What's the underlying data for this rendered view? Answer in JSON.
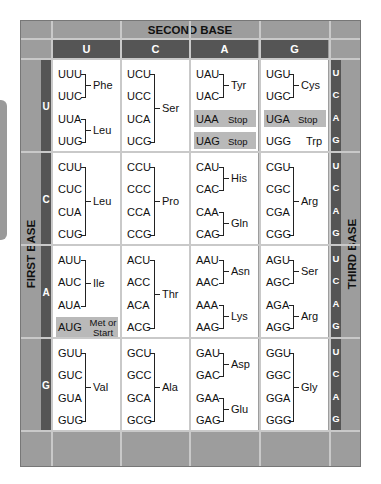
{
  "title": "SECOND BASE",
  "first_base_label": "FIRST BASE",
  "third_base_label": "THIRD BASE",
  "second_bases": [
    "U",
    "C",
    "A",
    "G"
  ],
  "first_bases": [
    "U",
    "C",
    "A",
    "G"
  ],
  "third_bases": [
    "U",
    "C",
    "A",
    "G"
  ],
  "colors": {
    "frame": "#9d9d9d",
    "bar": "#555555",
    "highlight": "#b9b9b9",
    "cell": "#ffffff"
  },
  "rows": [
    {
      "first": "U",
      "cells": [
        {
          "codons": [
            "UUU",
            "UUC",
            "UUA",
            "UUG"
          ],
          "groups": [
            {
              "span": [
                0,
                1
              ],
              "aa": "Phe"
            },
            {
              "span": [
                2,
                3
              ],
              "aa": "Leu"
            }
          ]
        },
        {
          "codons": [
            "UCU",
            "UCC",
            "UCA",
            "UCG"
          ],
          "groups": [
            {
              "span": [
                0,
                3
              ],
              "aa": "Ser"
            }
          ]
        },
        {
          "codons": [
            "UAU",
            "UAC",
            "UAA",
            "UAG"
          ],
          "groups": [
            {
              "span": [
                0,
                1
              ],
              "aa": "Tyr"
            }
          ],
          "special": [
            {
              "index": 2,
              "label": "Stop",
              "highlight": true
            },
            {
              "index": 3,
              "label": "Stop",
              "highlight": true
            }
          ]
        },
        {
          "codons": [
            "UGU",
            "UGC",
            "UGA",
            "UGG"
          ],
          "groups": [
            {
              "span": [
                0,
                1
              ],
              "aa": "Cys"
            }
          ],
          "special": [
            {
              "index": 2,
              "label": "Stop",
              "highlight": true
            },
            {
              "index": 3,
              "label": "Trp",
              "highlight": false
            }
          ]
        }
      ]
    },
    {
      "first": "C",
      "cells": [
        {
          "codons": [
            "CUU",
            "CUC",
            "CUA",
            "CUG"
          ],
          "groups": [
            {
              "span": [
                0,
                3
              ],
              "aa": "Leu"
            }
          ]
        },
        {
          "codons": [
            "CCU",
            "CCC",
            "CCA",
            "CCG"
          ],
          "groups": [
            {
              "span": [
                0,
                3
              ],
              "aa": "Pro"
            }
          ]
        },
        {
          "codons": [
            "CAU",
            "CAC",
            "CAA",
            "CAG"
          ],
          "groups": [
            {
              "span": [
                0,
                1
              ],
              "aa": "His"
            },
            {
              "span": [
                2,
                3
              ],
              "aa": "Gln"
            }
          ]
        },
        {
          "codons": [
            "CGU",
            "CGC",
            "CGA",
            "CGG"
          ],
          "groups": [
            {
              "span": [
                0,
                3
              ],
              "aa": "Arg"
            }
          ]
        }
      ]
    },
    {
      "first": "A",
      "cells": [
        {
          "codons": [
            "AUU",
            "AUC",
            "AUA",
            "AUG"
          ],
          "groups": [
            {
              "span": [
                0,
                2
              ],
              "aa": "Ile"
            }
          ],
          "special": [
            {
              "index": 3,
              "label": "Met or Start",
              "highlight": true
            }
          ]
        },
        {
          "codons": [
            "ACU",
            "ACC",
            "ACA",
            "ACG"
          ],
          "groups": [
            {
              "span": [
                0,
                3
              ],
              "aa": "Thr"
            }
          ]
        },
        {
          "codons": [
            "AAU",
            "AAC",
            "AAA",
            "AAG"
          ],
          "groups": [
            {
              "span": [
                0,
                1
              ],
              "aa": "Asn"
            },
            {
              "span": [
                2,
                3
              ],
              "aa": "Lys"
            }
          ]
        },
        {
          "codons": [
            "AGU",
            "AGC",
            "AGA",
            "AGG"
          ],
          "groups": [
            {
              "span": [
                0,
                1
              ],
              "aa": "Ser"
            },
            {
              "span": [
                2,
                3
              ],
              "aa": "Arg"
            }
          ]
        }
      ]
    },
    {
      "first": "G",
      "cells": [
        {
          "codons": [
            "GUU",
            "GUC",
            "GUA",
            "GUG"
          ],
          "groups": [
            {
              "span": [
                0,
                3
              ],
              "aa": "Val"
            }
          ]
        },
        {
          "codons": [
            "GCU",
            "GCC",
            "GCA",
            "GCG"
          ],
          "groups": [
            {
              "span": [
                0,
                3
              ],
              "aa": "Ala"
            }
          ]
        },
        {
          "codons": [
            "GAU",
            "GAC",
            "GAA",
            "GAG"
          ],
          "groups": [
            {
              "span": [
                0,
                1
              ],
              "aa": "Asp"
            },
            {
              "span": [
                2,
                3
              ],
              "aa": "Glu"
            }
          ]
        },
        {
          "codons": [
            "GGU",
            "GGC",
            "GGA",
            "GGG"
          ],
          "groups": [
            {
              "span": [
                0,
                3
              ],
              "aa": "Gly"
            }
          ]
        }
      ]
    }
  ]
}
